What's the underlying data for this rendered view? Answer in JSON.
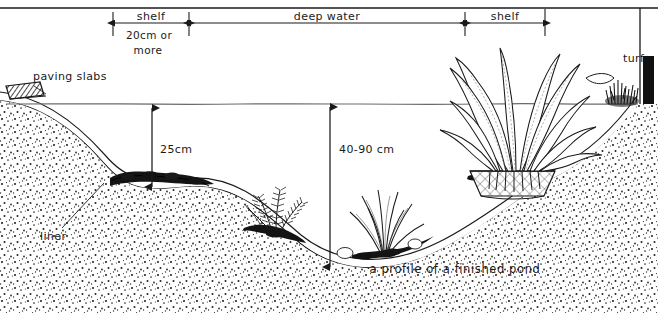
{
  "figure": {
    "title": "a profile of a finished pond",
    "caption": "a profile of a finished pond",
    "stroke_color": "#1a1a1a",
    "background_color": "#ffffff",
    "width": 658,
    "height": 313
  },
  "top_scale": {
    "segments": [
      {
        "label": "shelf",
        "sublabel_line1": "20cm or",
        "sublabel_line2": "more",
        "x_start": 113,
        "x_end": 189
      },
      {
        "label": "deep water",
        "sublabel_line1": "",
        "sublabel_line2": "",
        "x_start": 189,
        "x_end": 465
      },
      {
        "label": "shelf",
        "sublabel_line1": "",
        "sublabel_line2": "",
        "x_start": 465,
        "x_end": 545
      }
    ],
    "baseline_y": 23
  },
  "depth_dimensions": [
    {
      "name": "shelf-depth",
      "label": "25cm",
      "x": 152,
      "y_top": 107,
      "y_bottom": 188
    },
    {
      "name": "deep-water-depth",
      "label": "40-90 cm",
      "x": 330,
      "y_top": 106,
      "y_bottom": 268
    }
  ],
  "annotations": [
    {
      "name": "paving-slabs",
      "label": "paving slabs",
      "x": 33,
      "y": 80
    },
    {
      "name": "liner",
      "label": "liner",
      "x": 40,
      "y": 232
    },
    {
      "name": "turf",
      "label": "turf",
      "x": 626,
      "y": 58
    }
  ],
  "features": {
    "water_line_label": "water surface",
    "marginal_plant": "marginal plant in mesh basket on shelf",
    "oxygenators": [
      "oxygenating plant",
      "oxygenating plant"
    ],
    "soil_fill": "soil / substrate",
    "liner_material": "pond liner",
    "edging": "paving slabs",
    "turf_edge": "turf"
  },
  "colors": {
    "ink": "#1a1a1a",
    "paper": "#ffffff",
    "water": "#6a6a6a",
    "soil_dots": "#2a2a2a",
    "turf_block": "#111111"
  }
}
